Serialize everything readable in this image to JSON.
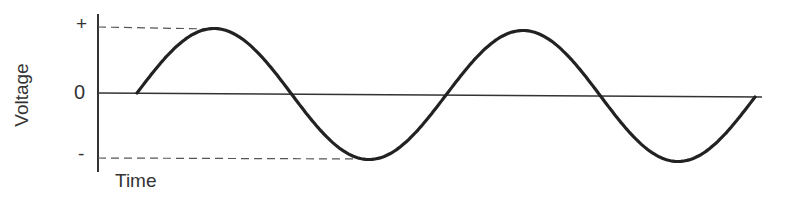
{
  "chart_data": {
    "type": "line",
    "title": "",
    "xlabel": "Time",
    "ylabel": "Voltage",
    "ytick_labels": [
      "+",
      "0",
      "-"
    ],
    "cycles": 2,
    "series": [
      {
        "name": "voltage",
        "x": [
          0,
          0.25,
          0.5,
          0.75,
          1,
          1.25,
          1.5,
          1.75,
          2
        ],
        "values": [
          0,
          1,
          0,
          -1,
          0,
          1,
          0,
          -1,
          0
        ]
      }
    ],
    "ylim": [
      -1,
      1
    ],
    "reference_lines": [
      "dashed line at +peak",
      "dashed line at -peak"
    ],
    "grid": false
  },
  "labels": {
    "y_axis": "Voltage",
    "x_axis": "Time",
    "plus": "+",
    "zero": "0",
    "minus": "-"
  }
}
